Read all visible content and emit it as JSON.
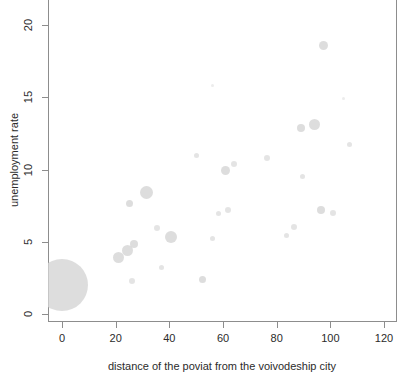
{
  "chart_data": {
    "type": "scatter",
    "title": "",
    "subtitle": "",
    "xlabel": "distance of the poviat from the voivodeship city",
    "ylabel": "unemployment rate",
    "xlim": [
      -5,
      125
    ],
    "ylim": [
      -1,
      21.5
    ],
    "xticks": [
      0,
      20,
      40,
      60,
      80,
      100,
      120
    ],
    "yticks": [
      0,
      5,
      10,
      15,
      20
    ],
    "grid": false,
    "legend": null,
    "marker_color": "#d4d4d4",
    "marker_shape": "circle",
    "size_encodes_third_variable": true,
    "series": [
      {
        "name": "poviats",
        "points": [
          {
            "x": 0,
            "y": 2.0,
            "size": 52
          },
          {
            "x": 21,
            "y": 3.9,
            "size": 11
          },
          {
            "x": 24.5,
            "y": 4.4,
            "size": 11
          },
          {
            "x": 25,
            "y": 7.65,
            "size": 7
          },
          {
            "x": 26,
            "y": 2.3,
            "size": 6
          },
          {
            "x": 27,
            "y": 4.85,
            "size": 8
          },
          {
            "x": 31.5,
            "y": 8.4,
            "size": 13
          },
          {
            "x": 35.5,
            "y": 5.95,
            "size": 6
          },
          {
            "x": 37,
            "y": 3.2,
            "size": 5
          },
          {
            "x": 40.5,
            "y": 5.35,
            "size": 12
          },
          {
            "x": 50,
            "y": 11.0,
            "size": 5
          },
          {
            "x": 52.5,
            "y": 2.4,
            "size": 7
          },
          {
            "x": 56,
            "y": 5.25,
            "size": 5
          },
          {
            "x": 58.5,
            "y": 6.95,
            "size": 5
          },
          {
            "x": 61,
            "y": 9.9,
            "size": 9
          },
          {
            "x": 62,
            "y": 7.2,
            "size": 6
          },
          {
            "x": 64,
            "y": 10.35,
            "size": 6
          },
          {
            "x": 76.5,
            "y": 10.8,
            "size": 6
          },
          {
            "x": 83.5,
            "y": 5.45,
            "size": 5
          },
          {
            "x": 86.5,
            "y": 6.0,
            "size": 6
          },
          {
            "x": 89,
            "y": 12.85,
            "size": 8
          },
          {
            "x": 89.5,
            "y": 9.5,
            "size": 5
          },
          {
            "x": 94,
            "y": 13.1,
            "size": 11
          },
          {
            "x": 96.5,
            "y": 7.2,
            "size": 8
          },
          {
            "x": 97.5,
            "y": 18.6,
            "size": 9
          },
          {
            "x": 101,
            "y": 7.0,
            "size": 6
          },
          {
            "x": 107,
            "y": 11.7,
            "size": 5
          },
          {
            "x": 56,
            "y": 15.8,
            "size": 3
          },
          {
            "x": 105,
            "y": 14.9,
            "size": 3
          }
        ]
      }
    ]
  },
  "axes": {
    "x_tick_labels": [
      "0",
      "20",
      "40",
      "60",
      "80",
      "100",
      "120"
    ],
    "y_tick_labels": [
      "0",
      "5",
      "10",
      "15",
      "20"
    ],
    "x_title": "distance of the poviat from the voivodeship city",
    "y_title": "unemployment rate"
  }
}
